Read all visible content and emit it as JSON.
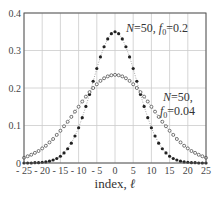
{
  "chart_data": {
    "type": "line",
    "title": "",
    "xlabel": "index, ℓ",
    "ylabel": "",
    "xlim": [
      -25,
      25
    ],
    "ylim": [
      0,
      0.4
    ],
    "grid": true,
    "x_ticks": [
      -25,
      -20,
      -15,
      -10,
      -5,
      0,
      5,
      10,
      15,
      20,
      25
    ],
    "x_tick_labels": [
      "- 25",
      "- 20",
      "- 15",
      "- 10",
      "- 5",
      "0",
      "5",
      "10",
      "15",
      "20",
      "25"
    ],
    "y_ticks": [
      0,
      0.1,
      0.2,
      0.3,
      0.4
    ],
    "y_tick_labels": [
      "0",
      "0.1",
      "0.2",
      "0.3",
      "0.4"
    ],
    "x": [
      -25,
      -24,
      -23,
      -22,
      -21,
      -20,
      -19,
      -18,
      -17,
      -16,
      -15,
      -14,
      -13,
      -12,
      -11,
      -10,
      -9,
      -8,
      -7,
      -6,
      -5,
      -4,
      -3,
      -2,
      -1,
      0,
      1,
      2,
      3,
      4,
      5,
      6,
      7,
      8,
      9,
      10,
      11,
      12,
      13,
      14,
      15,
      16,
      17,
      18,
      19,
      20,
      21,
      22,
      23,
      24,
      25
    ],
    "series": [
      {
        "name": "N=50, f0=0.2",
        "marker": "filled-dot",
        "values": [
          0,
          0,
          0,
          0.001,
          0.001,
          0.002,
          0.003,
          0.005,
          0.008,
          0.012,
          0.018,
          0.027,
          0.038,
          0.053,
          0.072,
          0.094,
          0.121,
          0.151,
          0.183,
          0.218,
          0.252,
          0.283,
          0.31,
          0.331,
          0.345,
          0.35,
          0.345,
          0.331,
          0.31,
          0.283,
          0.252,
          0.218,
          0.183,
          0.151,
          0.121,
          0.094,
          0.072,
          0.053,
          0.038,
          0.027,
          0.018,
          0.012,
          0.008,
          0.005,
          0.003,
          0.002,
          0.001,
          0.001,
          0,
          0,
          0
        ]
      },
      {
        "name": "N=50, f0=0.04",
        "marker": "open-circle",
        "values": [
          0.014,
          0.018,
          0.022,
          0.027,
          0.032,
          0.039,
          0.046,
          0.055,
          0.064,
          0.075,
          0.086,
          0.098,
          0.11,
          0.123,
          0.137,
          0.15,
          0.164,
          0.177,
          0.189,
          0.2,
          0.21,
          0.219,
          0.226,
          0.231,
          0.234,
          0.235,
          0.234,
          0.231,
          0.226,
          0.219,
          0.21,
          0.2,
          0.189,
          0.177,
          0.164,
          0.15,
          0.137,
          0.123,
          0.11,
          0.098,
          0.086,
          0.075,
          0.064,
          0.055,
          0.046,
          0.039,
          0.032,
          0.027,
          0.022,
          0.018,
          0.014
        ]
      }
    ],
    "annotations": [
      {
        "text_parts": [
          "N",
          "=50, ",
          "f",
          "0",
          "=0.2"
        ],
        "label": "N=50, f0=0.2"
      },
      {
        "text_parts": [
          "N",
          "=50,"
        ],
        "label": "N=50,"
      },
      {
        "text_parts": [
          "f",
          "0",
          "=0.04"
        ],
        "label": "f0=0.04"
      }
    ]
  },
  "labels": {
    "xlabel_main": "index, ",
    "xlabel_var": "ℓ",
    "ann1_N": "N",
    "ann1_mid": "=50, ",
    "ann1_f": "f",
    "ann1_sub": "0",
    "ann1_val": "=0.2",
    "ann2_N": "N",
    "ann2_rest": "=50,",
    "ann3_f": "f",
    "ann3_sub": "0",
    "ann3_val": "=0.04"
  },
  "colors": {
    "axis": "#555555",
    "grid": "#cccccc",
    "series": "#222222"
  }
}
